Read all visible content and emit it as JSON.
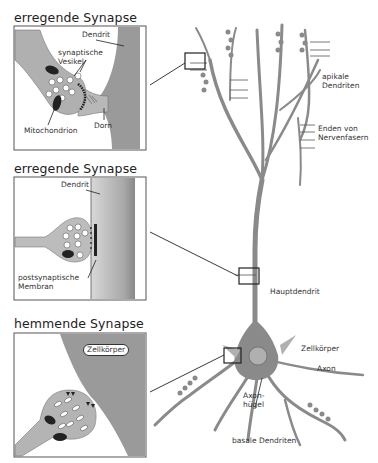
{
  "panels": [
    {
      "title": "erregende Synapse",
      "labels": {
        "dendrit": "Dendrit",
        "vesikel": "synaptische\nVesikel",
        "mito": "Mitochondrion",
        "dorn": "Dorn"
      }
    },
    {
      "title": "erregende Synapse",
      "labels": {
        "dendrit": "Dendrit",
        "membran": "postsynaptische\nMembran"
      }
    },
    {
      "title": "hemmende Synapse",
      "labels": {
        "zellkoerper": "Zellkörper"
      }
    }
  ],
  "neuron_labels": {
    "apikale": "apikale\nDendriten",
    "enden": "Enden von\nNervenfasern",
    "hauptdendrit": "Hauptdendrit",
    "zellkoerper": "Zellkörper",
    "axon": "Axon",
    "axonhuegel": "Axon-\nhügel",
    "basale": "basale Dendriten"
  },
  "colors": {
    "tissue": "#9a9a9a",
    "light": "#c8c8c8",
    "outline": "#333333"
  }
}
